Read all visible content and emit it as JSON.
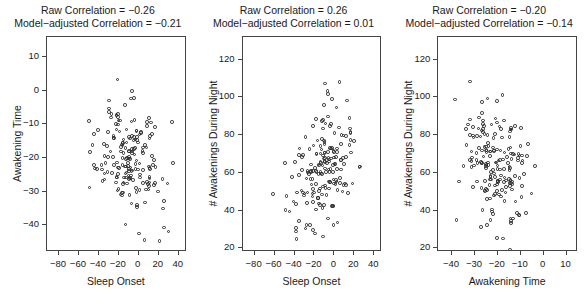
{
  "figure": {
    "type": "scatter-matrix",
    "panel_count": 3,
    "background_color": "#ffffff",
    "point_color": "#2b2b2b",
    "axis_color": "#444444",
    "point_style": "open-circle"
  },
  "chart_data": [
    {
      "type": "scatter",
      "panel_index": 0,
      "title": "Raw Correlation = −0.26\nModel−adjusted Correlation = −0.21",
      "title_lines": [
        "Raw Correlation = −0.26",
        "Model−adjusted Correlation = −0.21"
      ],
      "raw_correlation": -0.26,
      "model_adjusted_correlation": -0.21,
      "xlabel": "Sleep Onset",
      "ylabel": "Awakening Time",
      "xticks": [
        -80,
        -60,
        -40,
        -20,
        0,
        20,
        40
      ],
      "xticklabels": [
        "−80",
        "−60",
        "−40",
        "−20",
        "0",
        "20",
        "40"
      ],
      "yticks": [
        10,
        0,
        -10,
        -20,
        -30,
        -40
      ],
      "yticklabels": [
        "10",
        "0",
        "−10",
        "−20",
        "−30",
        "−40"
      ],
      "xlim": [
        -92,
        48
      ],
      "ylim": [
        -48,
        16
      ],
      "grid": false,
      "n_points": 185,
      "x_mean": -11.0,
      "x_sd": 17.0,
      "y_mean": -20.5,
      "y_sd": 8.2,
      "seed": 17
    },
    {
      "type": "scatter",
      "panel_index": 1,
      "title": "Raw Correlation = 0.26\nModel−adjusted Correlation = 0.01",
      "title_lines": [
        "Raw Correlation = 0.26",
        "Model−adjusted Correlation = 0.01"
      ],
      "raw_correlation": 0.26,
      "model_adjusted_correlation": 0.01,
      "xlabel": "Sleep Onset",
      "ylabel": "# Awakenings During Night",
      "xticks": [
        -80,
        -60,
        -40,
        -20,
        0,
        20,
        40
      ],
      "xticklabels": [
        "−80",
        "−60",
        "−40",
        "−20",
        "0",
        "20",
        "40"
      ],
      "yticks": [
        120,
        100,
        80,
        60,
        40,
        20
      ],
      "yticklabels": [
        "120",
        "100",
        "80",
        "60",
        "40",
        "20"
      ],
      "xlim": [
        -92,
        48
      ],
      "ylim": [
        18,
        132
      ],
      "grid": false,
      "n_points": 185,
      "x_mean": -11.0,
      "x_sd": 17.0,
      "y_mean": 63.0,
      "y_sd": 17.5,
      "seed": 43
    },
    {
      "type": "scatter",
      "panel_index": 2,
      "title": "Raw Correlation = −0.20\nModel−adjusted Correlation = −0.14",
      "title_lines": [
        "Raw Correlation = −0.20",
        "Model−adjusted Correlation = −0.14"
      ],
      "raw_correlation": -0.2,
      "model_adjusted_correlation": -0.14,
      "xlabel": "Awakening Time",
      "ylabel": "# Awakenings During Night",
      "xticks": [
        -40,
        -30,
        -20,
        -10,
        0,
        10
      ],
      "xticklabels": [
        "−40",
        "−30",
        "−20",
        "−10",
        "0",
        "10"
      ],
      "yticks": [
        120,
        100,
        80,
        60,
        40,
        20
      ],
      "yticklabels": [
        "120",
        "100",
        "80",
        "60",
        "40",
        "20"
      ],
      "xlim": [
        -46,
        15
      ],
      "ylim": [
        18,
        132
      ],
      "grid": false,
      "n_points": 185,
      "x_mean": -20.5,
      "x_sd": 8.2,
      "y_mean": 63.0,
      "y_sd": 17.5,
      "seed": 71
    }
  ]
}
